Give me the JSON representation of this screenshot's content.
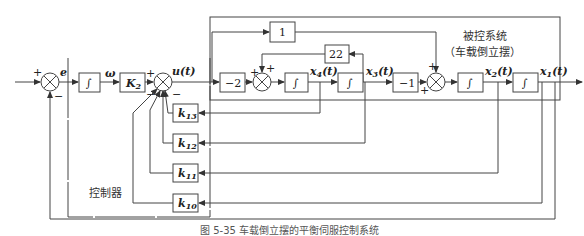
{
  "diagram": {
    "type": "block-diagram",
    "caption": "图 5-35 车载倒立摆的平衡伺服控制系统",
    "plant_label_line1": "被控系统",
    "plant_label_line2": "（车载倒立摆）",
    "controller_label": "控制器",
    "signals": {
      "error": "e",
      "omega": "ω",
      "control": "u(t)",
      "x4": "x4(t)",
      "x3": "x3(t)",
      "x2": "x2(t)",
      "x1": "x1(t)"
    },
    "blocks": {
      "integrator_symbol": "∫",
      "gain_k2": "K2",
      "gain_neg2": "−2",
      "gain_one": "1",
      "gain_22": "22",
      "gain_neg1": "−1",
      "k13": "k13",
      "k12": "k12",
      "k11": "k11",
      "k10": "k10"
    },
    "signs": {
      "plus": "+",
      "minus": "−"
    }
  }
}
